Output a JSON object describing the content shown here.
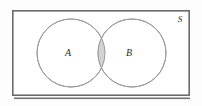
{
  "figure": {
    "name": "venn-diagram-two-sets-intersection",
    "type": "venn",
    "background_color": "#fdfdfd"
  },
  "universe": {
    "label": "S",
    "label_x": 180,
    "label_y": 22,
    "rect": {
      "x": 12,
      "y": 10,
      "width": 178,
      "height": 86
    },
    "border_color": "#6b6b6b",
    "border_width": 1.6,
    "fill_color": "#ffffff"
  },
  "sets": [
    {
      "label": "A",
      "cx": 71,
      "cy": 53,
      "r": 34,
      "label_x": 68,
      "label_y": 56,
      "stroke_color": "#9a9a9a",
      "fill_color": "#ffffff"
    },
    {
      "label": "B",
      "cx": 132,
      "cy": 53,
      "r": 34,
      "label_x": 129,
      "label_y": 56,
      "stroke_color": "#9a9a9a",
      "fill_color": "#ffffff"
    }
  ],
  "intersection": {
    "name": "A intersect B",
    "shaded": true,
    "fill_color": "#d2d2d2",
    "stroke_color": "#9a9a9a"
  },
  "shadow": {
    "color": "#5a5a5a",
    "bottom_y": 98
  }
}
